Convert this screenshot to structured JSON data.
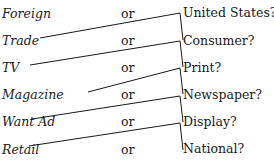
{
  "rows": [
    {
      "left": "Foreign",
      "or": "or",
      "right": "United States?"
    },
    {
      "left": "Trade",
      "or": "or",
      "right": "Consumer?"
    },
    {
      "left": "TV",
      "or": "or",
      "right": "Print?"
    },
    {
      "left": "Magazine",
      "or": "or",
      "right": "Newspaper?"
    },
    {
      "left": "Want Ad",
      "or": "or",
      "right": "Display?"
    },
    {
      "left": "Retail",
      "or": "or",
      "right": "National?"
    }
  ]
}
